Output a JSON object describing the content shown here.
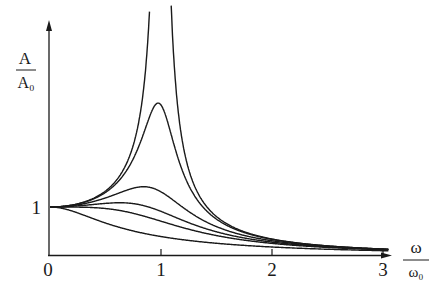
{
  "chart_data": {
    "type": "line",
    "title": "",
    "xlabel": {
      "numerator": "ω",
      "denominator": "ω₀"
    },
    "ylabel": {
      "numerator": "A",
      "denominator": "A₀"
    },
    "x_ticks": [
      {
        "value": 0,
        "label": "0"
      },
      {
        "value": 1,
        "label": "1"
      },
      {
        "value": 2,
        "label": "2"
      },
      {
        "value": 3,
        "label": "3"
      }
    ],
    "y_ticks": [
      {
        "value": 1,
        "label": "1"
      }
    ],
    "xlim": [
      0,
      3.1
    ],
    "ylim": [
      0,
      4.8
    ],
    "grid": false,
    "legend": null,
    "series": [
      {
        "name": "undamped (diverges at ω/ω0=1)",
        "damping": 0.0,
        "peak_x": 1.0,
        "peak_y": "off-scale"
      },
      {
        "name": "very light damping",
        "damping": 0.16,
        "peak_x": 0.97,
        "peak_y": 3.1
      },
      {
        "name": "light damping",
        "damping": 0.38,
        "peak_x": 0.85,
        "peak_y": 1.46
      },
      {
        "name": "medium damping",
        "damping": 0.55,
        "peak_x": 0.7,
        "peak_y": 1.15
      },
      {
        "name": "critical-ish damping",
        "damping": 0.71,
        "peak_x": 0.0,
        "peak_y": 1.0
      },
      {
        "name": "heavy damping",
        "damping": 1.3,
        "peak_x": 0.0,
        "peak_y": 1.0
      }
    ]
  }
}
